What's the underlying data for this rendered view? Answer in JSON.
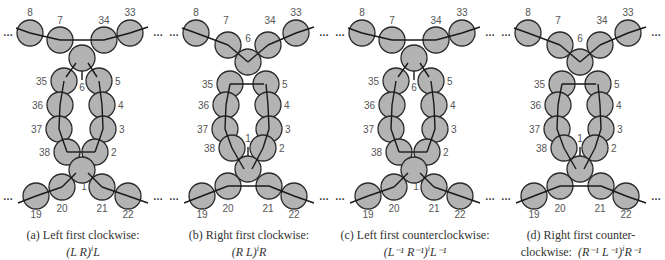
{
  "figure": {
    "panels": [
      {
        "id": "a",
        "caption_line1": "(a) Left first clockwise:",
        "caption_line2": "(L R)ᴵL",
        "formula_parts": {
          "base": "(L R)",
          "exp": "i",
          "tail": "L"
        },
        "top_junction_label": "6",
        "bottom_junction_label": "1",
        "variant": "left-cw"
      },
      {
        "id": "b",
        "caption_line1": "(b) Right first clockwise:",
        "formula_parts": {
          "base": "(R L)",
          "exp": "i",
          "tail": "R"
        },
        "top_junction_label": "6",
        "bottom_junction_label": "1",
        "variant": "right-cw"
      },
      {
        "id": "c",
        "caption_line1": "(c) Left first counterclockwise:",
        "formula_parts": {
          "base": "(L⁻¹ R⁻¹)",
          "exp": "i",
          "tail": "L⁻¹"
        },
        "top_junction_label": "6",
        "bottom_junction_label": "1",
        "variant": "left-ccw"
      },
      {
        "id": "d",
        "caption_line1": "(d) Right first counter-",
        "caption_line2_prefix": "clockwise:",
        "formula_parts": {
          "base": "(R⁻¹ L⁻¹)",
          "exp": "i",
          "tail": "R⁻¹"
        },
        "top_junction_label": "6",
        "bottom_junction_label": "1",
        "variant": "right-ccw"
      }
    ],
    "node_labels": {
      "top_left_outer": "8",
      "top_left_inner": "7",
      "top_right_inner": "34",
      "top_right_outer": "33",
      "left_column": [
        "35",
        "36",
        "37",
        "38"
      ],
      "right_column": [
        "5",
        "4",
        "3",
        "2"
      ],
      "bottom_left_inner": "20",
      "bottom_left_outer": "19",
      "bottom_right_inner": "21",
      "bottom_right_outer": "22"
    },
    "ellipsis": "…",
    "colors": {
      "circle_fill": "#b3b3b3",
      "circle_stroke": "#2a2a2a",
      "bond": "#1a1a1a",
      "label": "#555555"
    }
  }
}
